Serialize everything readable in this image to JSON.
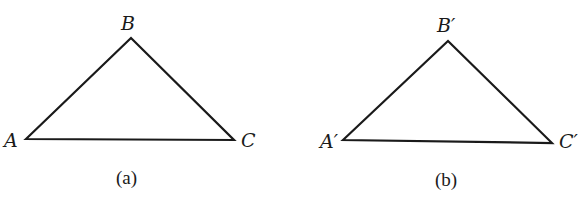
{
  "figures": [
    {
      "id": "a",
      "caption": "(a)",
      "vertices": {
        "A": {
          "label": "A",
          "x": 26,
          "y": 139
        },
        "B": {
          "label": "B",
          "x": 131,
          "y": 38
        },
        "C": {
          "label": "C",
          "x": 234,
          "y": 140
        }
      }
    },
    {
      "id": "b",
      "caption": "(b)",
      "vertices": {
        "A": {
          "label": "A′",
          "x": 343,
          "y": 140
        },
        "B": {
          "label": "B′",
          "x": 448,
          "y": 41
        },
        "C": {
          "label": "C′",
          "x": 552,
          "y": 143
        }
      }
    }
  ],
  "colors": {
    "stroke": "#1a1a1a",
    "background": "#ffffff"
  }
}
